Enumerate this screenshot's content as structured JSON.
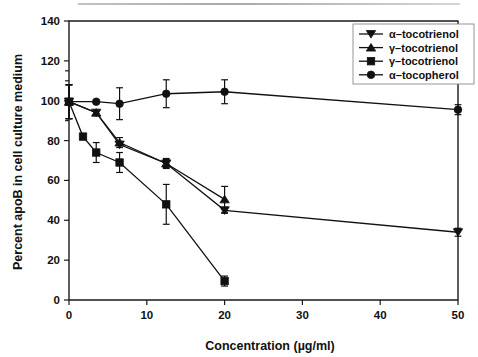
{
  "chart_data": {
    "type": "line",
    "title": "",
    "xlabel": "Concentration (µg/ml)",
    "ylabel": "Percent apoB in cell culture medium",
    "xlim": [
      0,
      50
    ],
    "ylim": [
      0,
      140
    ],
    "xticks": [
      0,
      10,
      20,
      30,
      40,
      50
    ],
    "yticks": [
      0,
      20,
      40,
      60,
      80,
      100,
      120,
      140
    ],
    "xtick_labels": [
      "0",
      "10",
      "20",
      "30",
      "40",
      "50"
    ],
    "ytick_labels": [
      "0",
      "20",
      "40",
      "60",
      "80",
      "100",
      "120",
      "140"
    ],
    "grid": false,
    "legend_position": "top-right",
    "error_bars": "standard error",
    "series": [
      {
        "name": "α–tocotrienol",
        "marker": "triangle-down",
        "x": [
          0,
          3.5,
          6.5,
          12.5,
          20,
          50
        ],
        "values": [
          99.5,
          94.0,
          78.0,
          68.5,
          45.0,
          34.0
        ],
        "errors": [
          8.5,
          0,
          0,
          2.0,
          1.5,
          2.0
        ]
      },
      {
        "name": "γ–tocotrienol",
        "marker": "triangle-up",
        "x": [
          0,
          3.5,
          6.5,
          12.5,
          20
        ],
        "values": [
          99.5,
          94.0,
          79.0,
          68.5,
          50.5
        ],
        "errors": [
          8.5,
          0,
          2.5,
          2.5,
          6.5
        ]
      },
      {
        "name": "γ–tocotrienol",
        "marker": "square",
        "x": [
          0,
          1.8,
          3.5,
          6.5,
          12.5,
          20
        ],
        "values": [
          99.5,
          82.0,
          74.0,
          69.0,
          48.0,
          9.5
        ],
        "errors": [
          8.5,
          0,
          5.0,
          5.0,
          10.0,
          2.5
        ]
      },
      {
        "name": "α–tocopherol",
        "marker": "circle",
        "x": [
          0,
          3.5,
          6.5,
          12.5,
          20,
          50
        ],
        "values": [
          99.5,
          99.5,
          98.5,
          103.5,
          104.5,
          95.5
        ],
        "errors": [
          8.5,
          0,
          8.0,
          7.0,
          6.0,
          2.5
        ]
      }
    ]
  },
  "legend": {
    "entries": [
      {
        "label": "α–tocotrienol",
        "marker": "triangle-down-icon"
      },
      {
        "label": "γ–tocotrienol",
        "marker": "triangle-up-icon"
      },
      {
        "label": "γ–tocotrienol",
        "marker": "square-icon"
      },
      {
        "label": "α–tocopherol",
        "marker": "circle-icon"
      }
    ]
  },
  "colors": {
    "ink": "#111111",
    "axis": "#1a1a1a",
    "background": "#ffffff",
    "legend_border": "#8a8a8a",
    "top_rule": "#9a9a9a"
  }
}
